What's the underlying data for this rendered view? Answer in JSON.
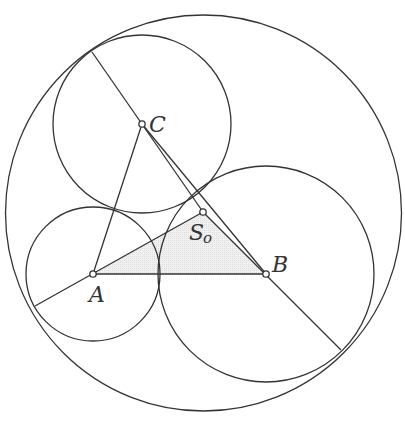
{
  "figure": {
    "type": "geometry-diagram",
    "colors": {
      "stroke": "#333333",
      "background": "#ffffff",
      "shade": "#e6e6e6"
    },
    "points": [
      {
        "id": "A",
        "label": "A",
        "x": 93,
        "y": 274
      },
      {
        "id": "B",
        "label": "B",
        "x": 266,
        "y": 274
      },
      {
        "id": "C",
        "label": "C",
        "x": 142,
        "y": 124
      },
      {
        "id": "S0",
        "label": "S",
        "subscript": "o",
        "x": 203,
        "y": 212
      }
    ],
    "circles": [
      {
        "id": "outer",
        "cx": 203.5,
        "cy": 213,
        "r": 198
      },
      {
        "id": "circle-A",
        "cx": 93,
        "cy": 274,
        "r": 67
      },
      {
        "id": "circle-B",
        "cx": 266,
        "cy": 274,
        "r": 108
      },
      {
        "id": "circle-C",
        "cx": 142,
        "cy": 124,
        "r": 89
      }
    ],
    "segments": [
      {
        "id": "A-B",
        "from": "A",
        "to": "B"
      },
      {
        "id": "A-C",
        "from": "A",
        "to": "C"
      },
      {
        "id": "C-B",
        "from": "C",
        "to": "B"
      },
      {
        "id": "outer-C-S0",
        "x1": 92,
        "y1": 52,
        "x2": 203,
        "y2": 212
      },
      {
        "id": "outer-A-S0",
        "x1": 35,
        "y1": 306,
        "x2": 203,
        "y2": 212
      },
      {
        "id": "S0-B-outer",
        "x1": 203,
        "y1": 212,
        "x2": 341,
        "y2": 350
      }
    ],
    "shaded_region": {
      "id": "triangle-A-S0-B",
      "vertices": [
        "A",
        "S0",
        "B"
      ]
    },
    "labels": {
      "A": "A",
      "B": "B",
      "C": "C",
      "S0_main": "S",
      "S0_sub": "o"
    }
  }
}
